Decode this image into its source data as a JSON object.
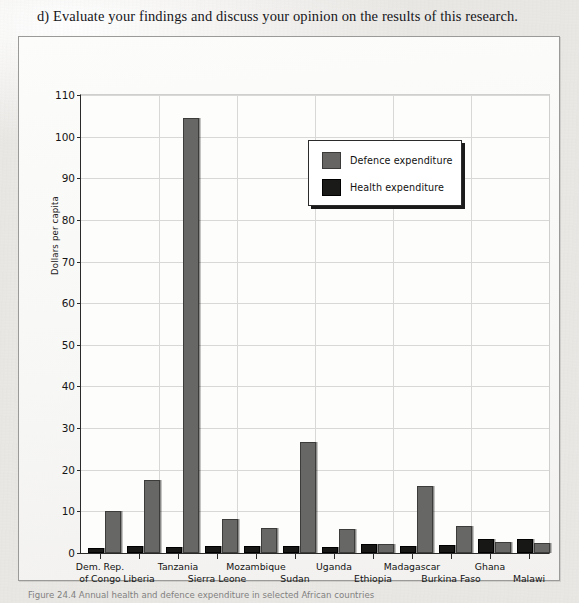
{
  "question": {
    "text": "d) Evaluate your findings and discuss your opinion on the results of this research."
  },
  "caption": {
    "text": "Figure 24.4 Annual health and defence expenditure in selected African countries"
  },
  "legend": {
    "position": "inside-top-right",
    "items": [
      {
        "label": "Defence expenditure",
        "color": "#676563",
        "swatch": "defence-swatch"
      },
      {
        "label": "Health expenditure",
        "color": "#1a1a19",
        "swatch": "health-swatch"
      }
    ]
  },
  "chart_data": {
    "type": "bar",
    "title": "",
    "xlabel": "",
    "ylabel": "Dollars per capita",
    "ylim": [
      0,
      110
    ],
    "yticks": [
      0,
      10,
      20,
      30,
      40,
      50,
      60,
      70,
      80,
      90,
      100,
      110
    ],
    "grid": true,
    "categories": [
      "Dem. Rep. of Congo",
      "Liberia",
      "Tanzania",
      "Sierra Leone",
      "Mozambique",
      "Sudan",
      "Uganda",
      "Ethiopia",
      "Madagascar",
      "Burkina Faso",
      "Ghana",
      "Malawi"
    ],
    "category_lines": [
      [
        "Dem. Rep.",
        "of Congo"
      ],
      [
        "Liberia"
      ],
      [
        "Tanzania"
      ],
      [
        "Sierra Leone"
      ],
      [
        "Mozambique"
      ],
      [
        "Sudan"
      ],
      [
        "Uganda"
      ],
      [
        "Ethiopia"
      ],
      [
        "Madagascar"
      ],
      [
        "Burkina Faso"
      ],
      [
        "Ghana"
      ],
      [
        "Malawi"
      ]
    ],
    "series": [
      {
        "name": "Health expenditure",
        "color": "#1a1a19",
        "values": [
          0.8,
          1.1,
          1.0,
          1.3,
          1.2,
          1.2,
          1.0,
          1.7,
          1.1,
          1.4,
          3.0,
          3.0
        ]
      },
      {
        "name": "Defence expenditure",
        "color": "#676563",
        "values": [
          9.5,
          17.0,
          104.0,
          7.8,
          5.5,
          26.2,
          5.3,
          1.7,
          15.5,
          6.0,
          2.2,
          1.9
        ]
      }
    ]
  }
}
